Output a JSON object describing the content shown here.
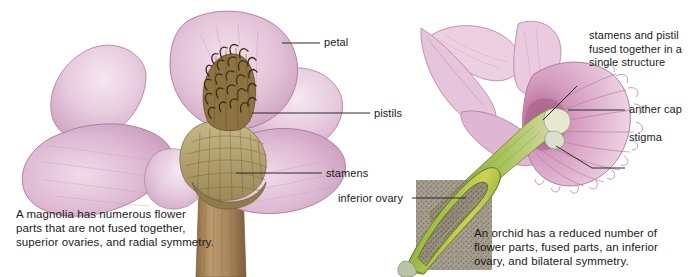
{
  "figure": {
    "background_color": "#ffffff",
    "width": 697,
    "height": 277
  },
  "palette": {
    "petal_pink_light": "#edd3e2",
    "petal_pink_mid": "#dcb0cc",
    "petal_pink_deep": "#c894b6",
    "petal_outline": "#9d6e8c",
    "pistil_brown": "#6b4f2a",
    "pistil_dark": "#3f2d14",
    "receptacle_tan": "#b5a371",
    "stem_brown": "#a8855c",
    "ovary_green": "#8fae3c",
    "ovary_green_dark": "#5d7d2a",
    "ovary_yellow": "#cfd24a",
    "seed_speckle": "#8d8270",
    "column_cream": "#e4e6cf",
    "leader_line": "#2b2b2b",
    "text_color": "#1a1a1a"
  },
  "magnolia": {
    "labels": [
      {
        "id": "petal",
        "text": "petal"
      },
      {
        "id": "pistils",
        "text": "pistils"
      },
      {
        "id": "stamens",
        "text": "stamens"
      }
    ],
    "caption": "A magnolia has numerous flower\nparts that are not fused together,\nsuperior ovaries, and radial symmetry."
  },
  "orchid": {
    "labels": [
      {
        "id": "fused_structure",
        "text": "stamens and pistil\nfused together in a\nsingle structure"
      },
      {
        "id": "anther_cap",
        "text": "anther cap"
      },
      {
        "id": "stigma",
        "text": "stigma"
      },
      {
        "id": "inferior_ovary",
        "text": "inferior ovary"
      }
    ],
    "caption": "An orchid has a reduced number of\nflower parts, fused parts, an inferior\novary, and bilateral symmetry."
  }
}
